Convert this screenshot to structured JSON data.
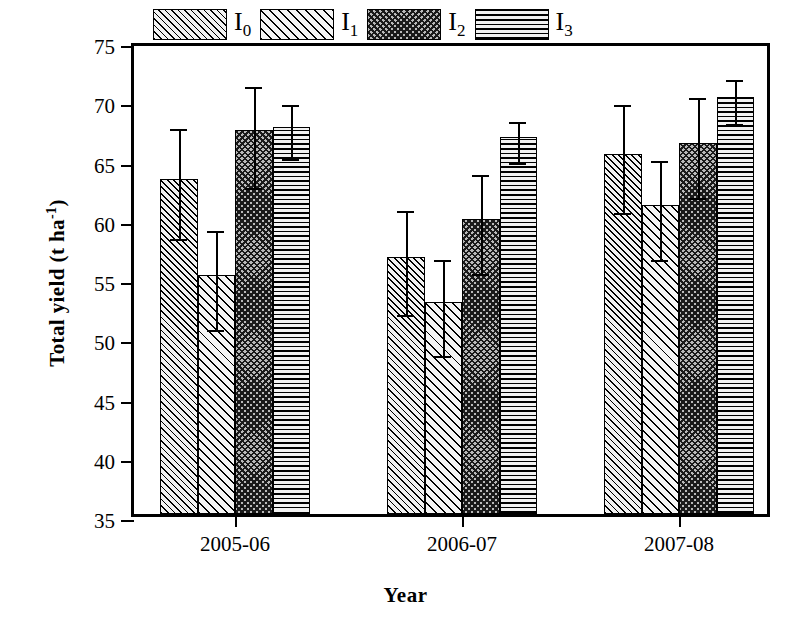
{
  "chart_data": {
    "type": "bar",
    "title": "",
    "xlabel": "Year",
    "ylabel": "Total yield (t ha",
    "ylabel_sup": "-1",
    "ylabel_tail": ")",
    "categories": [
      "2005-06",
      "2006-07",
      "2007-08"
    ],
    "yticks": [
      35,
      40,
      45,
      50,
      55,
      60,
      65,
      70,
      75
    ],
    "ylim": [
      35,
      75
    ],
    "grid": false,
    "legend_position": "top-center",
    "series": [
      {
        "name": "I0",
        "label_base": "I",
        "label_sub": "0",
        "pattern": "diagonal-dense",
        "values": [
          63.3,
          56.7,
          65.4
        ],
        "err_low": [
          58.7,
          52.3,
          60.9
        ],
        "err_high": [
          68.0,
          61.1,
          70.0
        ]
      },
      {
        "name": "I1",
        "label_base": "I",
        "label_sub": "1",
        "pattern": "diagonal-wide",
        "values": [
          55.2,
          52.9,
          61.1
        ],
        "err_low": [
          51.0,
          48.8,
          56.9
        ],
        "err_high": [
          59.4,
          56.9,
          65.3
        ]
      },
      {
        "name": "I2",
        "label_base": "I",
        "label_sub": "2",
        "pattern": "cross-hatch",
        "values": [
          67.4,
          59.9,
          66.3
        ],
        "err_low": [
          63.0,
          55.8,
          62.2
        ],
        "err_high": [
          71.5,
          64.1,
          70.6
        ]
      },
      {
        "name": "I3",
        "label_base": "I",
        "label_sub": "3",
        "pattern": "horizontal-lines",
        "values": [
          67.7,
          66.8,
          70.2
        ],
        "err_low": [
          65.5,
          65.1,
          68.4
        ],
        "err_high": [
          70.0,
          68.6,
          72.1
        ]
      }
    ]
  }
}
